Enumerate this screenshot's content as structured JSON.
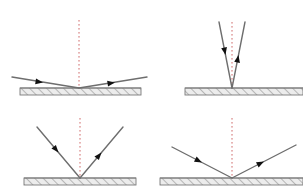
{
  "figure": {
    "background_color": "#ffffff",
    "width": 303,
    "height": 195,
    "ray_color": "#6e6e6e",
    "arrow_color": "#111111",
    "normal_color": "#d06a6a",
    "surface_line_color": "#7a7a7a",
    "surface_fill_color": "#e8e8e8",
    "hatch_color": "#8a8a8a"
  },
  "panels": [
    {
      "id": "panel-top-left",
      "name": "grazing-incidence",
      "label": "",
      "vertex": {
        "x": 79,
        "y": 88
      },
      "angle_from_normal_deg": 81,
      "surface": {
        "x1": 20,
        "x2": 141,
        "y": 88,
        "thickness": 7
      },
      "normal": {
        "x": 79,
        "y_top": 20,
        "y_bottom": 88
      },
      "incident_ray": {
        "x1": 12,
        "y1": 77,
        "x2": 79,
        "y2": 88
      },
      "reflected_ray": {
        "x1": 79,
        "y2": 77,
        "x2": 147,
        "y1": 88
      },
      "incident_arrow": {
        "x": 43,
        "y": 82.5,
        "dir_deg": 9
      },
      "reflected_arrow": {
        "x": 115,
        "y": 82.5,
        "dir_deg": -9
      }
    },
    {
      "id": "panel-top-right",
      "name": "near-normal-incidence",
      "label": "",
      "vertex": {
        "x": 232,
        "y": 88
      },
      "angle_from_normal_deg": 11,
      "surface": {
        "x1": 185,
        "x2": 303,
        "y": 88,
        "thickness": 7
      },
      "normal": {
        "x": 232,
        "y_top": 22,
        "y_bottom": 88
      },
      "incident_ray": {
        "x1": 219,
        "y1": 22,
        "x2": 232,
        "y2": 88
      },
      "reflected_ray": {
        "x1": 232,
        "y1": 88,
        "x2": 245,
        "y2": 22
      },
      "incident_arrow": {
        "x": 225.5,
        "y": 55,
        "dir_deg": 79
      },
      "reflected_arrow": {
        "x": 238.5,
        "y": 55,
        "dir_deg": -79
      }
    },
    {
      "id": "panel-bottom-left",
      "name": "oblique-incidence-40",
      "label": "",
      "vertex": {
        "x": 80,
        "y": 178
      },
      "angle_from_normal_deg": 40,
      "surface": {
        "x1": 24,
        "x2": 136,
        "y": 178,
        "thickness": 7
      },
      "normal": {
        "x": 80,
        "y_top": 118,
        "y_bottom": 178
      },
      "incident_ray": {
        "x1": 37,
        "y1": 127,
        "x2": 80,
        "y2": 178
      },
      "reflected_ray": {
        "x1": 80,
        "y1": 178,
        "x2": 123,
        "y2": 127
      },
      "incident_arrow": {
        "x": 58.5,
        "y": 152.5,
        "dir_deg": 50
      },
      "reflected_arrow": {
        "x": 101.5,
        "y": 152.5,
        "dir_deg": -50
      }
    },
    {
      "id": "panel-bottom-right",
      "name": "oblique-incidence-62",
      "label": "",
      "vertex": {
        "x": 232,
        "y": 178
      },
      "angle_from_normal_deg": 62,
      "surface": {
        "x1": 160,
        "x2": 303,
        "y": 178,
        "thickness": 7
      },
      "normal": {
        "x": 232,
        "y_top": 118,
        "y_bottom": 178
      },
      "incident_ray": {
        "x1": 172,
        "y1": 147,
        "x2": 232,
        "y2": 178
      },
      "reflected_ray": {
        "x1": 232,
        "y1": 178,
        "x2": 296,
        "y2": 145
      },
      "incident_arrow": {
        "x": 202,
        "y": 162.5,
        "dir_deg": 27
      },
      "reflected_arrow": {
        "x": 264,
        "y": 161.5,
        "dir_deg": -27
      }
    }
  ]
}
